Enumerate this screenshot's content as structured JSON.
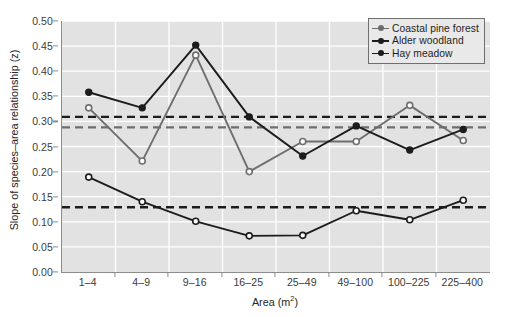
{
  "chart_data": {
    "type": "line",
    "title": "",
    "xlabel": "Area (m2)",
    "xlabel_base": "Area (m",
    "xlabel_sup": "2",
    "xlabel_tail": ")",
    "ylabel": "Slope of species–area relationship (z)",
    "categories": [
      "1–4",
      "4–9",
      "9–16",
      "16–25",
      "25–49",
      "49–100",
      "100–225",
      "225–400"
    ],
    "ylim": [
      0.0,
      0.5
    ],
    "yticks": [
      0.0,
      0.05,
      0.1,
      0.15,
      0.2,
      0.25,
      0.3,
      0.35,
      0.4,
      0.45,
      0.5
    ],
    "ytick_labels": [
      "0.00",
      "0.05",
      "0.10",
      "0.15",
      "0.20",
      "0.25",
      "0.30",
      "0.35",
      "0.40",
      "0.45",
      "0.50"
    ],
    "grid": true,
    "grid_color": "#ffffff",
    "plot_background": "#e2e2e2",
    "legend_position": "top-right",
    "series": [
      {
        "name": "Coastal pine forest",
        "color": "#6e6e6e",
        "marker": "open-circle",
        "marker_fill": "#ffffff",
        "values": [
          0.327,
          0.221,
          0.432,
          0.2,
          0.26,
          0.26,
          0.332,
          0.262
        ]
      },
      {
        "name": "Alder woodland",
        "color": "#1c1c1c",
        "marker": "filled-circle",
        "marker_fill": "#1c1c1c",
        "values": [
          0.358,
          0.327,
          0.452,
          0.309,
          0.231,
          0.291,
          0.243,
          0.284
        ]
      },
      {
        "name": "Hay meadow",
        "color": "#1c1c1c",
        "marker": "open-circle",
        "marker_fill": "#ffffff",
        "values": [
          0.189,
          0.14,
          0.101,
          0.072,
          0.073,
          0.122,
          0.104,
          0.143
        ]
      }
    ],
    "reference_lines": [
      {
        "name": "Alder woodland mean",
        "value": 0.309,
        "color": "#1c1c1c",
        "style": "dashed"
      },
      {
        "name": "Coastal pine forest mean",
        "value": 0.288,
        "color": "#6e6e6e",
        "style": "dashed"
      },
      {
        "name": "Hay meadow mean",
        "value": 0.129,
        "color": "#1c1c1c",
        "style": "dashed"
      }
    ]
  },
  "legend": {
    "items": [
      {
        "label": "Coastal pine forest"
      },
      {
        "label": "Alder woodland"
      },
      {
        "label": "Hay meadow"
      }
    ]
  }
}
